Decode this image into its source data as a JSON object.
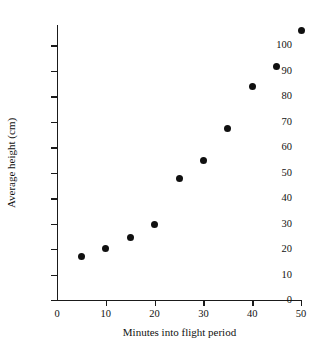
{
  "chart_data": {
    "type": "scatter",
    "title": "",
    "xlabel": "Minutes into flight period",
    "ylabel": "Average height (cm)",
    "xlim": [
      0,
      50
    ],
    "ylim": [
      0,
      108
    ],
    "grid": false,
    "legend": null,
    "xticks": [
      "0",
      "10",
      "20",
      "30",
      "40",
      "50"
    ],
    "xtick_values": [
      0,
      10,
      20,
      30,
      40,
      50
    ],
    "yticks": [
      "0",
      "10",
      "20",
      "30",
      "40",
      "50",
      "60",
      "70",
      "80",
      "90",
      "100"
    ],
    "ytick_values": [
      0,
      10,
      20,
      30,
      40,
      50,
      60,
      70,
      80,
      90,
      100
    ],
    "x": [
      5,
      10,
      15,
      20,
      25,
      30,
      35,
      40,
      45,
      50
    ],
    "y": [
      17.2,
      20.2,
      24.6,
      29.6,
      47.8,
      54.8,
      67.4,
      84.0,
      91.8,
      106.0
    ],
    "points": [
      {
        "x": 5,
        "y": 17.2
      },
      {
        "x": 10,
        "y": 20.2
      },
      {
        "x": 15,
        "y": 24.6
      },
      {
        "x": 20,
        "y": 29.6
      },
      {
        "x": 25,
        "y": 47.8
      },
      {
        "x": 30,
        "y": 54.8
      },
      {
        "x": 35,
        "y": 67.4
      },
      {
        "x": 40,
        "y": 84.0
      },
      {
        "x": 45,
        "y": 91.8
      },
      {
        "x": 50,
        "y": 106.0
      }
    ],
    "marker": {
      "shape": "circle",
      "color": "#101010",
      "size": 7
    },
    "axis_color": "#1a1a1a",
    "background": "#ffffff"
  }
}
